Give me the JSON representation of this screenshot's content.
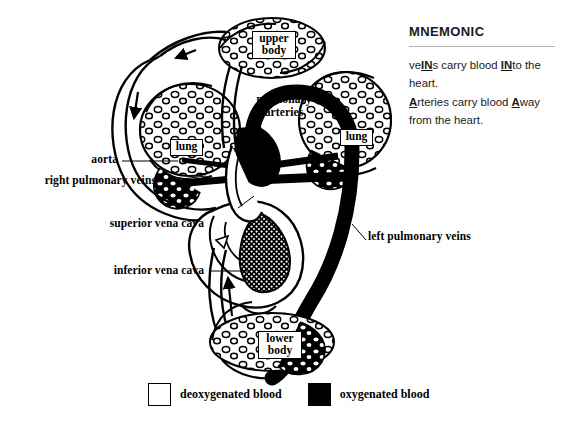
{
  "figure": {
    "title_alt": "Double circulation of blood through the heart and lungs",
    "background_color": "#ffffff",
    "ink_color": "#000000"
  },
  "labels": {
    "aorta": "aorta",
    "right_pulmonary_veins": "right pulmonary veins",
    "superior_vena_cava": "superior vena cava",
    "inferior_vena_cava": "inferior vena cava",
    "left_pulmonary_veins": "left pulmonary veins",
    "pulmonary_arteries_line1": "pulmonary",
    "pulmonary_arteries_line2": "arteries",
    "lung_left": "lung",
    "lung_right": "lung",
    "upper_body_line1": "upper",
    "upper_body_line2": "body",
    "lower_body_line1": "lower",
    "lower_body_line2": "body"
  },
  "legend": {
    "deoxygenated": {
      "label": "deoxygenated blood",
      "swatch_color": "#ffffff"
    },
    "oxygenated": {
      "label": "oxygenated blood",
      "swatch_color": "#000000"
    }
  },
  "mnemonic": {
    "heading": "MNEMONIC",
    "line1_a": "ve",
    "line1_em1": "IN",
    "line1_b": "s carry blood ",
    "line1_em2": "IN",
    "line1_c": "to the heart.",
    "line2_em1": "A",
    "line2_a": "rteries carry blood ",
    "line2_em2": "A",
    "line2_b": "way from the heart."
  }
}
